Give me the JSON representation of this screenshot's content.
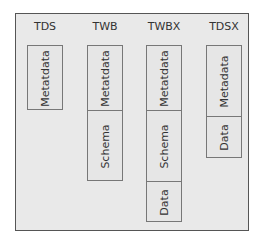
{
  "diagram": {
    "columns": [
      {
        "title": "TDS",
        "cells": [
          "Metatdata"
        ]
      },
      {
        "title": "TWB",
        "cells": [
          "Metatdata",
          "Schema"
        ]
      },
      {
        "title": "TWBX",
        "cells": [
          "Metatdata",
          "Schema",
          "Data"
        ]
      },
      {
        "title": "TDSX",
        "cells": [
          "Metadata",
          "Data"
        ]
      }
    ]
  }
}
